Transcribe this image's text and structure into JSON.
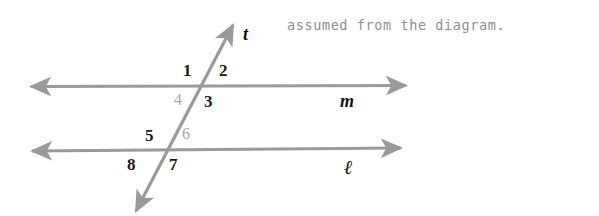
{
  "caption": {
    "text": "assumed from the diagram."
  },
  "diagram": {
    "type": "parallel-lines-transversal",
    "stroke_color": "#9a9a9a",
    "label_color": "#1a1a1a",
    "faded_label_color": "#a8a8a8",
    "background": "#ffffff",
    "lines": [
      {
        "name": "line-m",
        "label": "m",
        "orientation": "horizontal",
        "y": 86,
        "x_start": 31,
        "x_end": 406,
        "arrows": "both"
      },
      {
        "name": "line-ell",
        "label": "ℓ",
        "orientation": "horizontal",
        "y": 150,
        "x_start": 32,
        "x_end": 401,
        "arrows": "both"
      },
      {
        "name": "transversal-t",
        "label": "t",
        "orientation": "oblique",
        "x_top": 233,
        "y_top": 25,
        "x_bottom": 136,
        "y_bottom": 211,
        "arrows": "both"
      }
    ],
    "intersections": [
      {
        "name": "intersection-m-t",
        "x": 205,
        "y": 86
      },
      {
        "name": "intersection-ell-t",
        "x": 170,
        "y": 150
      }
    ],
    "angle_labels": [
      {
        "id": "1",
        "text": "1",
        "x": 183,
        "y": 62,
        "faded": false,
        "position": "upper-left-of-m"
      },
      {
        "id": "2",
        "text": "2",
        "x": 219,
        "y": 62,
        "faded": false,
        "position": "upper-right-of-m"
      },
      {
        "id": "4",
        "text": "4",
        "x": 174,
        "y": 92,
        "faded": true,
        "position": "lower-left-of-m"
      },
      {
        "id": "3",
        "text": "3",
        "x": 204,
        "y": 93,
        "faded": false,
        "position": "lower-right-of-m"
      },
      {
        "id": "5",
        "text": "5",
        "x": 145,
        "y": 127,
        "faded": false,
        "position": "upper-left-of-ell"
      },
      {
        "id": "6",
        "text": "6",
        "x": 182,
        "y": 126,
        "faded": true,
        "position": "upper-right-of-ell"
      },
      {
        "id": "8",
        "text": "8",
        "x": 127,
        "y": 156,
        "faded": false,
        "position": "lower-left-of-ell"
      },
      {
        "id": "7",
        "text": "7",
        "x": 169,
        "y": 156,
        "faded": false,
        "position": "lower-right-of-ell"
      }
    ],
    "line_name_labels": [
      {
        "id": "t",
        "text": "t",
        "x": 243,
        "y": 25,
        "style": "line-label"
      },
      {
        "id": "m",
        "text": "m",
        "x": 340,
        "y": 92,
        "style": "line-label"
      },
      {
        "id": "ell",
        "text": "ℓ",
        "x": 344,
        "y": 157,
        "style": "script-ell"
      }
    ]
  }
}
